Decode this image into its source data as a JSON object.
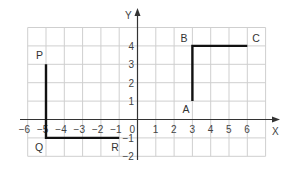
{
  "diagram": {
    "type": "coordinate-grid",
    "axes": {
      "x_label": "X",
      "y_label": "Y",
      "x_range": [
        -6,
        7
      ],
      "y_range": [
        -2,
        5
      ],
      "x_ticks": [
        "-6",
        "-5",
        "-4",
        "-3",
        "-2",
        "-1",
        "0",
        "1",
        "2",
        "3",
        "4",
        "5",
        "6"
      ],
      "y_ticks": [
        "4",
        "3",
        "2",
        "1",
        "-1",
        "-2"
      ]
    },
    "points": [
      {
        "label": "P",
        "x": -5,
        "y": 3
      },
      {
        "label": "Q",
        "x": -5,
        "y": -1
      },
      {
        "label": "R",
        "x": -1,
        "y": -1
      },
      {
        "label": "A",
        "x": 3,
        "y": 1
      },
      {
        "label": "B",
        "x": 3,
        "y": 4
      },
      {
        "label": "C",
        "x": 6,
        "y": 4
      }
    ],
    "paths": [
      {
        "name": "PQR",
        "points": [
          "P",
          "Q",
          "R"
        ]
      },
      {
        "name": "ABC",
        "points": [
          "A",
          "B",
          "C"
        ]
      }
    ],
    "colors": {
      "grid": "#cfcfcf",
      "axis": "#333333",
      "path": "#111111",
      "text": "#444444"
    }
  }
}
